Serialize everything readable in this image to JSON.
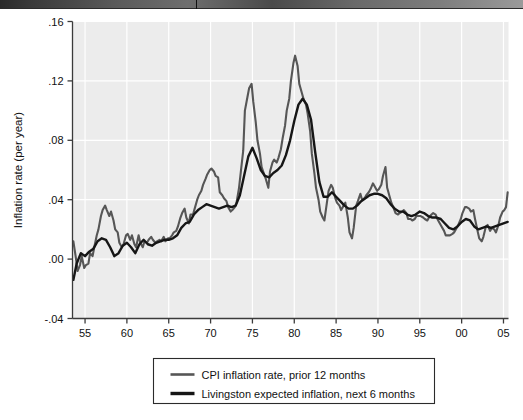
{
  "figure": {
    "page_edge_name": "scanned-page-edge-bar"
  },
  "chart_data": {
    "type": "line",
    "title": "",
    "subtitle": "",
    "xlabel": "",
    "ylabel": "Inflation rate (per year)",
    "xlim": [
      1953.5,
      2005.6
    ],
    "ylim": [
      -0.04,
      0.16
    ],
    "grid": true,
    "grid_color": "#ffffff",
    "plot_bg": "#ececec",
    "legend_position": "below-axes",
    "xticks": [
      1955,
      1960,
      1965,
      1970,
      1975,
      1980,
      1985,
      1990,
      1995,
      2000,
      2005
    ],
    "xtick_labels": [
      "55",
      "60",
      "65",
      "70",
      "75",
      "80",
      "85",
      "90",
      "95",
      "00",
      "05"
    ],
    "yticks": [
      -0.04,
      0.0,
      0.04,
      0.08,
      0.12,
      0.16
    ],
    "ytick_labels": [
      "-.04",
      ".00",
      ".04",
      ".08",
      ".12",
      ".16"
    ],
    "series": [
      {
        "name": "CPI inflation rate, prior 12 months",
        "color": "#565656",
        "width": 2.1,
        "x": [
          1953.6,
          1953.9,
          1954.1,
          1954.4,
          1954.6,
          1954.9,
          1955.1,
          1955.4,
          1955.6,
          1955.9,
          1956.1,
          1956.4,
          1956.6,
          1956.9,
          1957.1,
          1957.4,
          1957.6,
          1957.9,
          1958.1,
          1958.4,
          1958.6,
          1958.9,
          1959.1,
          1959.4,
          1959.6,
          1959.9,
          1960.1,
          1960.4,
          1960.6,
          1960.9,
          1961.1,
          1961.4,
          1961.6,
          1961.9,
          1962.1,
          1962.4,
          1962.6,
          1962.9,
          1963.1,
          1963.4,
          1963.6,
          1963.9,
          1964.1,
          1964.4,
          1964.6,
          1964.9,
          1965.1,
          1965.4,
          1965.6,
          1965.9,
          1966.1,
          1966.4,
          1966.6,
          1966.9,
          1967.1,
          1967.4,
          1967.6,
          1967.9,
          1968.1,
          1968.4,
          1968.6,
          1968.9,
          1969.1,
          1969.4,
          1969.6,
          1969.9,
          1970.1,
          1970.4,
          1970.6,
          1970.9,
          1971.1,
          1971.4,
          1971.6,
          1971.9,
          1972.1,
          1972.4,
          1972.6,
          1972.9,
          1973.1,
          1973.4,
          1973.6,
          1973.9,
          1974.1,
          1974.4,
          1974.6,
          1974.9,
          1975.1,
          1975.4,
          1975.6,
          1975.9,
          1976.1,
          1976.4,
          1976.6,
          1976.9,
          1977.1,
          1977.4,
          1977.6,
          1977.9,
          1978.1,
          1978.4,
          1978.6,
          1978.9,
          1979.1,
          1979.4,
          1979.6,
          1979.9,
          1980.1,
          1980.4,
          1980.6,
          1980.9,
          1981.1,
          1981.4,
          1981.6,
          1981.9,
          1982.1,
          1982.4,
          1982.6,
          1982.9,
          1983.1,
          1983.4,
          1983.6,
          1983.9,
          1984.1,
          1984.4,
          1984.6,
          1984.9,
          1985.1,
          1985.4,
          1985.6,
          1985.9,
          1986.1,
          1986.4,
          1986.6,
          1986.9,
          1987.1,
          1987.4,
          1987.6,
          1987.9,
          1988.1,
          1988.4,
          1988.6,
          1988.9,
          1989.1,
          1989.4,
          1989.6,
          1989.9,
          1990.1,
          1990.4,
          1990.6,
          1990.9,
          1991.1,
          1991.4,
          1991.6,
          1991.9,
          1992.1,
          1992.4,
          1992.6,
          1992.9,
          1993.1,
          1993.4,
          1993.6,
          1993.9,
          1994.1,
          1994.4,
          1994.6,
          1994.9,
          1995.1,
          1995.4,
          1995.6,
          1995.9,
          1996.1,
          1996.4,
          1996.6,
          1996.9,
          1997.1,
          1997.4,
          1997.6,
          1997.9,
          1998.1,
          1998.4,
          1998.6,
          1998.9,
          1999.1,
          1999.4,
          1999.6,
          1999.9,
          2000.1,
          2000.4,
          2000.6,
          2000.9,
          2001.1,
          2001.4,
          2001.6,
          2001.9,
          2002.1,
          2002.4,
          2002.6,
          2002.9,
          2003.1,
          2003.4,
          2003.6,
          2003.9,
          2004.1,
          2004.4,
          2004.6,
          2004.9,
          2005.1,
          2005.3,
          2005.5
        ],
        "y": [
          0.012,
          0.001,
          -0.008,
          -0.004,
          0.002,
          -0.006,
          -0.004,
          -0.003,
          0.004,
          0.002,
          0.008,
          0.016,
          0.02,
          0.029,
          0.033,
          0.036,
          0.033,
          0.029,
          0.032,
          0.026,
          0.02,
          0.018,
          0.011,
          0.008,
          0.01,
          0.016,
          0.017,
          0.013,
          0.016,
          0.01,
          0.008,
          0.016,
          0.011,
          0.008,
          0.012,
          0.011,
          0.013,
          0.015,
          0.013,
          0.011,
          0.012,
          0.013,
          0.012,
          0.015,
          0.012,
          0.014,
          0.014,
          0.016,
          0.018,
          0.019,
          0.022,
          0.028,
          0.031,
          0.034,
          0.028,
          0.024,
          0.03,
          0.03,
          0.034,
          0.04,
          0.043,
          0.046,
          0.05,
          0.054,
          0.057,
          0.06,
          0.061,
          0.059,
          0.056,
          0.055,
          0.045,
          0.043,
          0.041,
          0.039,
          0.035,
          0.032,
          0.033,
          0.035,
          0.038,
          0.048,
          0.058,
          0.073,
          0.1,
          0.109,
          0.115,
          0.118,
          0.106,
          0.092,
          0.08,
          0.071,
          0.062,
          0.057,
          0.054,
          0.048,
          0.059,
          0.065,
          0.067,
          0.065,
          0.068,
          0.074,
          0.081,
          0.09,
          0.1,
          0.108,
          0.12,
          0.132,
          0.137,
          0.13,
          0.118,
          0.112,
          0.108,
          0.104,
          0.098,
          0.086,
          0.071,
          0.058,
          0.048,
          0.04,
          0.032,
          0.028,
          0.026,
          0.038,
          0.046,
          0.05,
          0.048,
          0.041,
          0.038,
          0.036,
          0.033,
          0.036,
          0.038,
          0.028,
          0.018,
          0.014,
          0.021,
          0.036,
          0.039,
          0.044,
          0.04,
          0.041,
          0.043,
          0.045,
          0.047,
          0.051,
          0.049,
          0.046,
          0.047,
          0.05,
          0.056,
          0.062,
          0.048,
          0.042,
          0.038,
          0.034,
          0.031,
          0.03,
          0.031,
          0.032,
          0.033,
          0.031,
          0.027,
          0.027,
          0.026,
          0.027,
          0.029,
          0.029,
          0.029,
          0.028,
          0.027,
          0.026,
          0.028,
          0.03,
          0.031,
          0.03,
          0.027,
          0.024,
          0.022,
          0.019,
          0.016,
          0.016,
          0.016,
          0.017,
          0.018,
          0.021,
          0.023,
          0.027,
          0.031,
          0.035,
          0.035,
          0.034,
          0.032,
          0.033,
          0.027,
          0.019,
          0.014,
          0.012,
          0.015,
          0.022,
          0.023,
          0.019,
          0.021,
          0.02,
          0.018,
          0.023,
          0.028,
          0.032,
          0.033,
          0.035,
          0.045
        ]
      },
      {
        "name": "Livingston expected inflation, next 6 months",
        "color": "#161616",
        "width": 2.4,
        "x": [
          1953.6,
          1954.0,
          1954.5,
          1955.0,
          1955.5,
          1956.0,
          1956.5,
          1957.0,
          1957.5,
          1958.0,
          1958.5,
          1959.0,
          1959.5,
          1960.0,
          1960.5,
          1961.0,
          1961.5,
          1962.0,
          1962.5,
          1963.0,
          1963.5,
          1964.0,
          1964.5,
          1965.0,
          1965.5,
          1966.0,
          1966.5,
          1967.0,
          1967.5,
          1968.0,
          1968.5,
          1969.0,
          1969.5,
          1970.0,
          1970.5,
          1971.0,
          1971.5,
          1972.0,
          1972.5,
          1973.0,
          1973.5,
          1974.0,
          1974.5,
          1975.0,
          1975.5,
          1976.0,
          1976.5,
          1977.0,
          1977.5,
          1978.0,
          1978.5,
          1979.0,
          1979.5,
          1980.0,
          1980.5,
          1981.0,
          1981.5,
          1982.0,
          1982.5,
          1983.0,
          1983.5,
          1984.0,
          1984.5,
          1985.0,
          1985.5,
          1986.0,
          1986.5,
          1987.0,
          1987.5,
          1988.0,
          1988.5,
          1989.0,
          1989.5,
          1990.0,
          1990.5,
          1991.0,
          1991.5,
          1992.0,
          1992.5,
          1993.0,
          1993.5,
          1994.0,
          1994.5,
          1995.0,
          1995.5,
          1996.0,
          1996.5,
          1997.0,
          1997.5,
          1998.0,
          1998.5,
          1999.0,
          1999.5,
          2000.0,
          2000.5,
          2001.0,
          2001.5,
          2002.0,
          2002.5,
          2003.0,
          2003.5,
          2004.0,
          2004.5,
          2005.0,
          2005.5
        ],
        "y": [
          -0.014,
          -0.003,
          0.004,
          0.002,
          0.005,
          0.007,
          0.012,
          0.014,
          0.013,
          0.008,
          0.002,
          0.004,
          0.009,
          0.011,
          0.008,
          0.004,
          0.01,
          0.013,
          0.01,
          0.009,
          0.011,
          0.012,
          0.013,
          0.013,
          0.014,
          0.016,
          0.021,
          0.024,
          0.025,
          0.03,
          0.033,
          0.035,
          0.037,
          0.036,
          0.035,
          0.034,
          0.035,
          0.036,
          0.035,
          0.036,
          0.043,
          0.056,
          0.069,
          0.075,
          0.068,
          0.06,
          0.056,
          0.055,
          0.058,
          0.06,
          0.063,
          0.07,
          0.08,
          0.093,
          0.104,
          0.108,
          0.104,
          0.094,
          0.072,
          0.052,
          0.042,
          0.042,
          0.045,
          0.042,
          0.039,
          0.036,
          0.034,
          0.034,
          0.036,
          0.039,
          0.041,
          0.043,
          0.044,
          0.044,
          0.043,
          0.041,
          0.037,
          0.034,
          0.032,
          0.032,
          0.03,
          0.029,
          0.03,
          0.032,
          0.031,
          0.029,
          0.028,
          0.028,
          0.027,
          0.024,
          0.021,
          0.02,
          0.022,
          0.025,
          0.027,
          0.026,
          0.022,
          0.02,
          0.021,
          0.022,
          0.021,
          0.022,
          0.023,
          0.024,
          0.025
        ]
      }
    ]
  },
  "legend": {
    "items": [
      {
        "label": "CPI inflation rate, prior 12 months",
        "color": "#565656"
      },
      {
        "label": "Livingston expected inflation, next 6 months",
        "color": "#161616"
      }
    ]
  }
}
